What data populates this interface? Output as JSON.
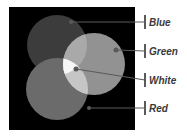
{
  "figure": {
    "background_color": "#000000",
    "circles": [
      {
        "name": "Blue",
        "fill": "#3c3c3c"
      },
      {
        "name": "Red",
        "fill": "#6b6b6b"
      },
      {
        "name": "Green",
        "fill": "#929292"
      }
    ],
    "overlaps": {
      "blue_green": "#a9a9a9",
      "red_green": "#c6c6c6",
      "blue_red": "#6b6b6b",
      "white_center": "#f7f7f7"
    },
    "marker_color": "#5a5a5a",
    "leader_color": "#5a5a5a"
  },
  "labels": [
    {
      "text": "Blue"
    },
    {
      "text": "Green"
    },
    {
      "text": "White"
    },
    {
      "text": "Red"
    }
  ]
}
